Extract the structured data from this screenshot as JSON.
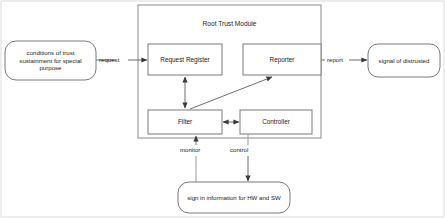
{
  "diagram": {
    "title_visible": false,
    "outer_frame": {
      "name": "diagram-border"
    },
    "module": {
      "label": "Root Trust Module",
      "x": 138,
      "y": 5,
      "w": 183,
      "h": 133
    },
    "nodes": [
      {
        "id": "request-register",
        "label": "Request Register",
        "shape": "rect",
        "x": 148,
        "y": 44,
        "w": 74,
        "h": 31
      },
      {
        "id": "reporter",
        "label": "Reporter",
        "shape": "rect",
        "x": 243,
        "y": 44,
        "w": 78,
        "h": 31
      },
      {
        "id": "filter",
        "label": "Filter",
        "shape": "rect",
        "x": 148,
        "y": 110,
        "w": 74,
        "h": 24
      },
      {
        "id": "controller",
        "label": "Controller",
        "shape": "rect",
        "x": 240,
        "y": 110,
        "w": 72,
        "h": 24
      },
      {
        "id": "conditions-of-trust",
        "label": "conditions of trust sustainment for special purpose",
        "shape": "rounded",
        "x": 5,
        "y": 41,
        "w": 91,
        "h": 39
      },
      {
        "id": "signal-of-distrusted",
        "label": "signal of distrusted",
        "shape": "rounded",
        "x": 368,
        "y": 44,
        "w": 72,
        "h": 33
      },
      {
        "id": "sign-in-information",
        "label": "sign in information for HW and SW",
        "shape": "rounded",
        "x": 178,
        "y": 182,
        "w": 112,
        "h": 31
      }
    ],
    "edges": [
      {
        "id": "request",
        "label": "request",
        "from": "conditions-of-trust",
        "to": "request-register",
        "arrow": "single"
      },
      {
        "id": "report",
        "label": "report",
        "from": "reporter",
        "to": "signal-of-distrusted",
        "arrow": "single"
      },
      {
        "id": "register-filter",
        "label": "",
        "from": "request-register",
        "to": "filter",
        "arrow": "double"
      },
      {
        "id": "filter-reporter",
        "label": "",
        "from": "filter",
        "to": "reporter",
        "arrow": "single"
      },
      {
        "id": "filter-controller",
        "label": "",
        "from": "filter",
        "to": "controller",
        "arrow": "double"
      },
      {
        "id": "monitor",
        "label": "monitor",
        "from": "sign-in-information",
        "to": "filter",
        "arrow": "single"
      },
      {
        "id": "control",
        "label": "control",
        "from": "controller",
        "to": "sign-in-information",
        "arrow": "single"
      }
    ],
    "edge_labels": {
      "request": {
        "text": "request",
        "x": 99,
        "y": 57
      },
      "report": {
        "text": "report",
        "x": 327,
        "y": 57
      },
      "monitor": {
        "text": "monitor",
        "x": 183,
        "y": 150
      },
      "control": {
        "text": "control",
        "x": 231,
        "y": 150
      }
    },
    "colors": {
      "stroke": "#6f6f6f",
      "node_stroke": "#7a7a7a",
      "text": "#1a1a1a",
      "background": "#ffffff",
      "frame": "#d9d9d9"
    }
  }
}
